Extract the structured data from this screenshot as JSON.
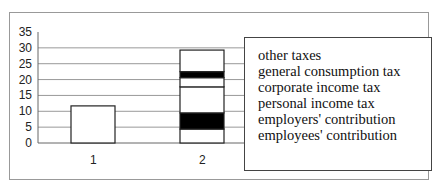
{
  "chart_data": {
    "type": "bar",
    "stacked": true,
    "title": "",
    "xlabel": "",
    "ylabel": "",
    "ylim": [
      0,
      35
    ],
    "yticks": [
      0,
      5,
      10,
      15,
      20,
      25,
      30,
      35
    ],
    "grid": true,
    "legend_position": "right",
    "categories": [
      "1",
      "2"
    ],
    "series": [
      {
        "name": "employees' contribution",
        "values": [
          11.7,
          4.4
        ],
        "color": "#ffffff"
      },
      {
        "name": "employers' contribution",
        "values": [
          0,
          5.1
        ],
        "color": "#000000"
      },
      {
        "name": "personal income tax",
        "values": [
          0,
          8.2
        ],
        "color": "#ffffff"
      },
      {
        "name": "corporate income tax",
        "values": [
          0,
          2.9
        ],
        "color": "#ffffff"
      },
      {
        "name": "general consumption tax",
        "values": [
          0,
          1.9
        ],
        "color": "#000000"
      },
      {
        "name": "other taxes",
        "values": [
          0,
          6.8
        ],
        "color": "#ffffff"
      }
    ],
    "totals": [
      11.7,
      29.3
    ]
  },
  "legend": {
    "items": [
      "other taxes",
      "general consumption tax",
      "corporate income tax",
      "personal income tax",
      "employers' contribution",
      "employees' contribution"
    ]
  }
}
